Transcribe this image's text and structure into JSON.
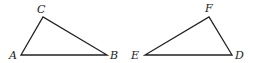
{
  "diagram": {
    "triangles": [
      {
        "name": "ABC",
        "vertices": [
          {
            "label": "A",
            "x": 21,
            "y": 55,
            "lx": 9,
            "ly": 59
          },
          {
            "label": "B",
            "x": 107,
            "y": 55,
            "lx": 110,
            "ly": 59
          },
          {
            "label": "C",
            "x": 43,
            "y": 17,
            "lx": 37,
            "ly": 13
          }
        ]
      },
      {
        "name": "DEF",
        "vertices": [
          {
            "label": "E",
            "x": 145,
            "y": 55,
            "lx": 131,
            "ly": 59
          },
          {
            "label": "D",
            "x": 232,
            "y": 55,
            "lx": 235,
            "ly": 59
          },
          {
            "label": "F",
            "x": 209,
            "y": 17,
            "lx": 205,
            "ly": 12
          }
        ]
      }
    ],
    "labels": {
      "A": "A",
      "B": "B",
      "C": "C",
      "D": "D",
      "E": "E",
      "F": "F"
    }
  }
}
